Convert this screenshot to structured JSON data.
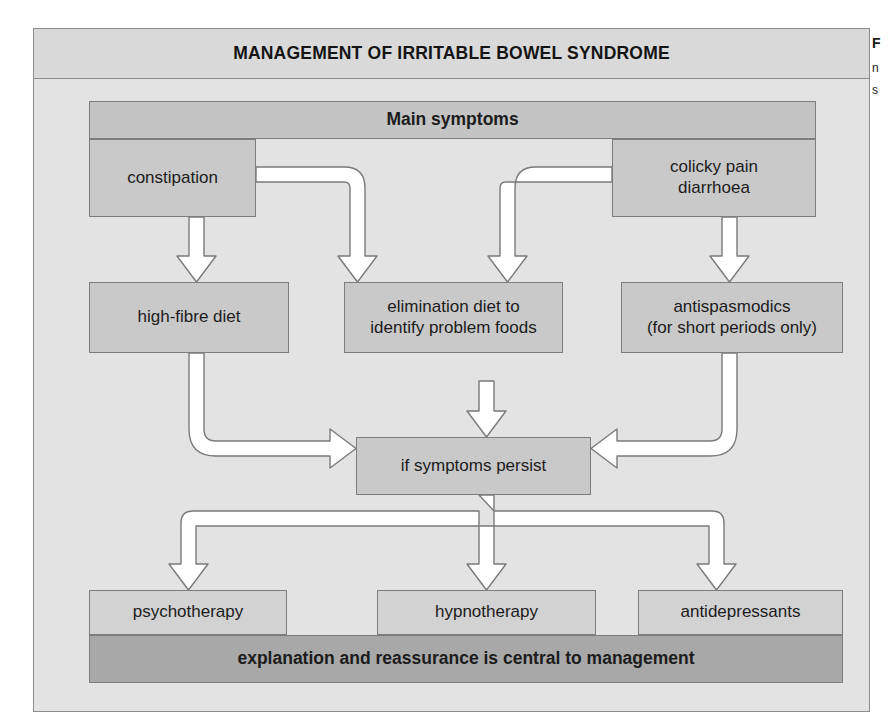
{
  "figure": {
    "title": "MANAGEMENT OF IRRITABLE BOWEL SYNDROME",
    "header_row": {
      "label": "Main symptoms"
    },
    "symptoms": [
      {
        "id": "constipation",
        "label": "constipation"
      },
      {
        "id": "colicky-pain-diarrhoea",
        "label": "colicky pain\ndiarrhoea"
      }
    ],
    "first_line_treatments": [
      {
        "id": "high-fibre-diet",
        "label": "high-fibre diet"
      },
      {
        "id": "elimination-diet",
        "label": "elimination diet to\nidentify problem foods"
      },
      {
        "id": "antispasmodics",
        "label": "antispasmodics\n(for short periods only)"
      }
    ],
    "decision": {
      "id": "if-symptoms-persist",
      "label": "if symptoms persist"
    },
    "second_line_treatments": [
      {
        "id": "psychotherapy",
        "label": "psychotherapy"
      },
      {
        "id": "hypnotherapy",
        "label": "hypnotherapy"
      },
      {
        "id": "antidepressants",
        "label": "antidepressants"
      }
    ],
    "footer": {
      "label": "explanation and reassurance is central to management"
    }
  },
  "side_caption": {
    "title": "F",
    "line1": "n",
    "line2": "s"
  },
  "colors": {
    "frame_background": "#e3e3e3",
    "title_background": "#d9d9d9",
    "node_background": "#c9c9c9",
    "node_light_background": "#d2d2d2",
    "footer_background": "#a8a8a8",
    "border": "#7d7d7d",
    "arrow_fill": "#ffffff",
    "arrow_stroke": "#7a7a7a",
    "text": "#1c1c1c"
  }
}
